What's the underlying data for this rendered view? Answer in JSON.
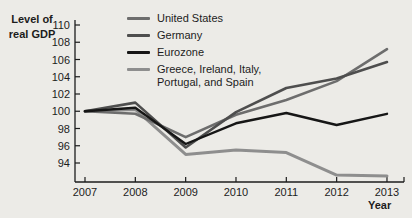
{
  "figure": {
    "background": "#ecebe7",
    "text_color": "#1c1c1c"
  },
  "chart_data": {
    "type": "line",
    "title": "",
    "ylabel_lines": [
      "Level of",
      "real GDP"
    ],
    "xlabel": "Year",
    "x": [
      2007,
      2008,
      2009,
      2010,
      2011,
      2012,
      2013
    ],
    "y_ticks": [
      94,
      96,
      98,
      100,
      102,
      104,
      106,
      108,
      110
    ],
    "ylim": [
      92.3,
      110
    ],
    "grid": "off",
    "legend_position": "top-center",
    "series": [
      {
        "name": "United States",
        "label_lines": [
          "United States"
        ],
        "color": "#6d6d6d",
        "stroke_width": 2.6,
        "values": [
          100,
          99.7,
          97.0,
          99.6,
          101.3,
          103.5,
          107.2
        ]
      },
      {
        "name": "Germany",
        "label_lines": [
          "Germany"
        ],
        "color": "#4e4e4e",
        "stroke_width": 2.6,
        "values": [
          100,
          101.0,
          95.8,
          99.9,
          102.7,
          103.8,
          105.7
        ]
      },
      {
        "name": "Eurozone",
        "label_lines": [
          "Eurozone"
        ],
        "color": "#161616",
        "stroke_width": 2.4,
        "values": [
          100,
          100.4,
          96.2,
          98.6,
          99.8,
          98.4,
          99.7
        ]
      },
      {
        "name": "Greece, Ireland, Italy, Portugal, and Spain",
        "label_lines": [
          "Greece, Ireland, Italy,",
          "Portugal, and Spain"
        ],
        "color": "#8e8e8e",
        "stroke_width": 3,
        "values": [
          100,
          100.2,
          95.0,
          95.5,
          95.2,
          92.6,
          92.5
        ]
      }
    ]
  }
}
